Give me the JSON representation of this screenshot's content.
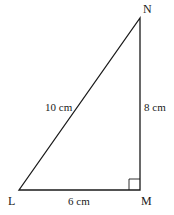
{
  "diagram": {
    "type": "right-triangle",
    "vertices": [
      {
        "name": "L",
        "x": 19,
        "y": 190
      },
      {
        "name": "M",
        "x": 140,
        "y": 190
      },
      {
        "name": "N",
        "x": 140,
        "y": 18
      }
    ],
    "right_angle_at": "M",
    "sides": [
      {
        "from": "L",
        "to": "N",
        "label": "10 cm"
      },
      {
        "from": "N",
        "to": "M",
        "label": "8 cm"
      },
      {
        "from": "L",
        "to": "M",
        "label": "6 cm"
      }
    ],
    "stroke_color": "#1a1a1a"
  }
}
